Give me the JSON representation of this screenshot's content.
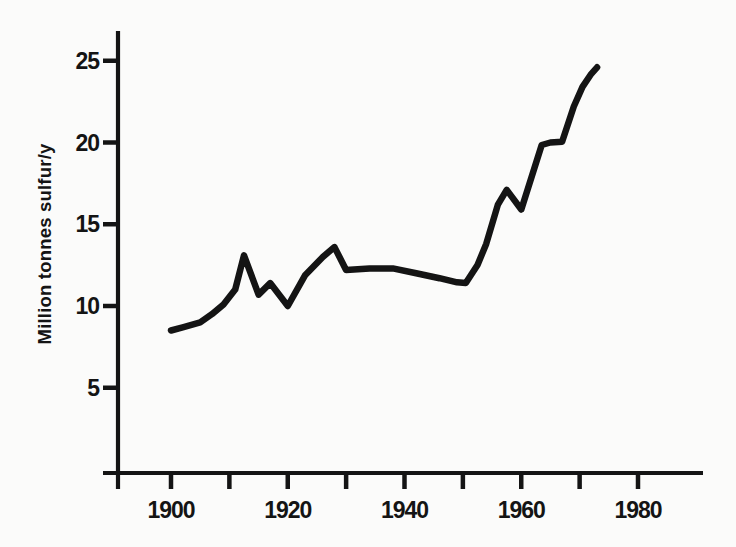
{
  "page": {
    "background": "#fbfbfa",
    "ink_color": "#141414"
  },
  "chart_data": {
    "type": "line",
    "title": "",
    "xlabel": "",
    "ylabel": "Million tonnes sulfur/y",
    "x": [
      1900,
      1902,
      1905,
      1907,
      1909,
      1911,
      1912.5,
      1915,
      1917,
      1920,
      1923,
      1926,
      1928,
      1930,
      1934,
      1938,
      1942,
      1946,
      1949,
      1950.5,
      1952.5,
      1954,
      1956,
      1957.5,
      1960,
      1963.5,
      1965,
      1967,
      1969,
      1970.5,
      1972,
      1973
    ],
    "y": [
      8.5,
      8.7,
      9.0,
      9.5,
      10.1,
      11.0,
      13.1,
      10.7,
      11.4,
      10.0,
      11.9,
      13.0,
      13.6,
      12.2,
      12.3,
      12.3,
      12.0,
      11.7,
      11.45,
      11.4,
      12.5,
      13.8,
      16.2,
      17.1,
      15.9,
      19.85,
      20.0,
      20.05,
      22.2,
      23.4,
      24.2,
      24.6
    ],
    "x_ticks": [
      {
        "value": 1900,
        "label": "1900"
      },
      {
        "value": 1910,
        "label": ""
      },
      {
        "value": 1920,
        "label": "1920"
      },
      {
        "value": 1930,
        "label": ""
      },
      {
        "value": 1940,
        "label": "1940"
      },
      {
        "value": 1950,
        "label": ""
      },
      {
        "value": 1960,
        "label": "1960"
      },
      {
        "value": 1970,
        "label": ""
      },
      {
        "value": 1980,
        "label": "1980"
      }
    ],
    "y_ticks": [
      {
        "value": 5,
        "label": "5"
      },
      {
        "value": 10,
        "label": "10"
      },
      {
        "value": 15,
        "label": "15"
      },
      {
        "value": 20,
        "label": "20"
      },
      {
        "value": 25,
        "label": "25"
      }
    ],
    "xlim": [
      1891,
      1991
    ],
    "ylim": [
      0,
      26.8
    ],
    "grid": false,
    "legend": "none",
    "line_color": "#141414"
  }
}
